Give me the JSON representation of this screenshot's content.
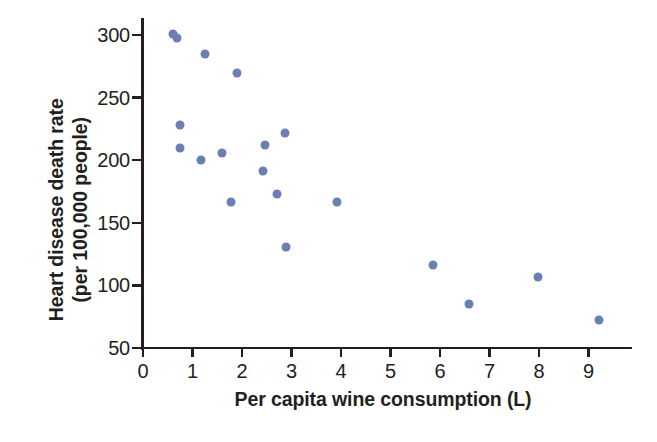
{
  "chart_data": {
    "type": "scatter",
    "title": "",
    "xlabel": "Per capita wine consumption (L)",
    "ylabel_line1": "Heart disease death rate",
    "ylabel_line2": "(per 100,000 people)",
    "xlim": [
      0,
      9.8
    ],
    "ylim": [
      50,
      310
    ],
    "xticks": [
      0,
      1,
      2,
      3,
      4,
      5,
      6,
      7,
      8,
      9
    ],
    "xtick_labels": [
      "0",
      "1",
      "2",
      "3",
      "4",
      "5",
      "6",
      "7",
      "8",
      "9"
    ],
    "yticks": [
      50,
      100,
      150,
      200,
      250,
      300
    ],
    "ytick_labels": [
      "50",
      "100",
      "150",
      "200",
      "250",
      "300"
    ],
    "grid": false,
    "legend": null,
    "marker_color": "#6b7fb5",
    "axis_color": "#231f20",
    "background_color": "#ffffff",
    "points": [
      {
        "x": 0.61,
        "y": 301
      },
      {
        "x": 0.69,
        "y": 298
      },
      {
        "x": 1.25,
        "y": 285
      },
      {
        "x": 1.9,
        "y": 270
      },
      {
        "x": 0.75,
        "y": 228
      },
      {
        "x": 0.75,
        "y": 210
      },
      {
        "x": 1.17,
        "y": 200
      },
      {
        "x": 1.6,
        "y": 206
      },
      {
        "x": 1.78,
        "y": 167
      },
      {
        "x": 2.42,
        "y": 191
      },
      {
        "x": 2.46,
        "y": 212
      },
      {
        "x": 2.71,
        "y": 173
      },
      {
        "x": 2.87,
        "y": 222
      },
      {
        "x": 2.89,
        "y": 131
      },
      {
        "x": 3.92,
        "y": 167
      },
      {
        "x": 5.86,
        "y": 116
      },
      {
        "x": 6.59,
        "y": 85
      },
      {
        "x": 7.98,
        "y": 107
      },
      {
        "x": 9.21,
        "y": 72
      }
    ]
  }
}
